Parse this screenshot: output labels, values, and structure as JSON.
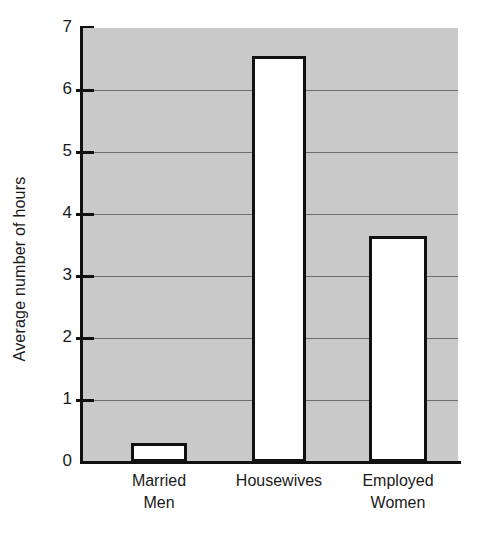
{
  "chart_data": {
    "type": "bar",
    "title": "",
    "subtitle": "",
    "xlabel": "",
    "ylabel": "Average number of hours",
    "categories": [
      "Married\nMen",
      "Housewives",
      "Employed\nWomen"
    ],
    "values": [
      0.3,
      6.55,
      3.65
    ],
    "ylim": [
      0,
      7
    ],
    "ytick_labels": [
      "0",
      "1",
      "2",
      "3",
      "4",
      "5",
      "6",
      "7"
    ],
    "ytick_values": [
      0,
      1,
      2,
      3,
      4,
      5,
      6,
      7
    ],
    "grid": true,
    "grid_axis": "y",
    "legend": false,
    "legend_position": "none",
    "plot_background": "#c9c9c9",
    "bar_fill": "#ffffff",
    "bar_edge": "#111111",
    "axis_color": "#111111",
    "gridline_color": "#6e6e6e"
  }
}
